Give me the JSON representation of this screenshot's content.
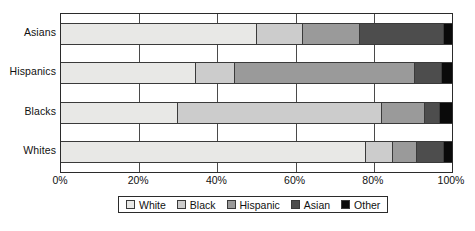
{
  "chart_data": {
    "type": "bar",
    "orientation": "horizontal",
    "stacked": true,
    "normalized": true,
    "title": "",
    "subtitle": "",
    "xlabel": "",
    "ylabel": "",
    "xlim": [
      0,
      100
    ],
    "grid": true,
    "legend_position": "bottom",
    "categories": [
      "Whites",
      "Blacks",
      "Hispanics",
      "Asians"
    ],
    "category_order_top_to_bottom": [
      "Asians",
      "Hispanics",
      "Blacks",
      "Whites"
    ],
    "tick_labels": [
      "0%",
      "20%",
      "40%",
      "60%",
      "80%",
      "100%"
    ],
    "tick_values": [
      0,
      20,
      40,
      60,
      80,
      100
    ],
    "series": [
      {
        "name": "White",
        "color": "#e8e8e6",
        "values": [
          78.0,
          30.0,
          34.5,
          50.0
        ]
      },
      {
        "name": "Black",
        "color": "#cccccc",
        "values": [
          7.0,
          52.0,
          10.0,
          12.0
        ]
      },
      {
        "name": "Hispanic",
        "color": "#9a9a9a",
        "values": [
          6.0,
          11.0,
          46.0,
          14.5
        ]
      },
      {
        "name": "Asian",
        "color": "#4d4d4d",
        "values": [
          7.0,
          4.0,
          7.0,
          21.5
        ]
      },
      {
        "name": "Other",
        "color": "#0a0a0a",
        "values": [
          2.0,
          3.0,
          2.5,
          2.0
        ]
      }
    ]
  },
  "legend": {
    "items": [
      {
        "label": "White",
        "color": "#e8e8e6"
      },
      {
        "label": "Black",
        "color": "#cccccc"
      },
      {
        "label": "Hispanic",
        "color": "#9a9a9a"
      },
      {
        "label": "Asian",
        "color": "#4d4d4d"
      },
      {
        "label": "Other",
        "color": "#0a0a0a"
      }
    ]
  },
  "axes": {
    "plot_border_color": "#2b2b2b",
    "gridline_color": "#4a4a4a",
    "text_color": "#111111"
  }
}
